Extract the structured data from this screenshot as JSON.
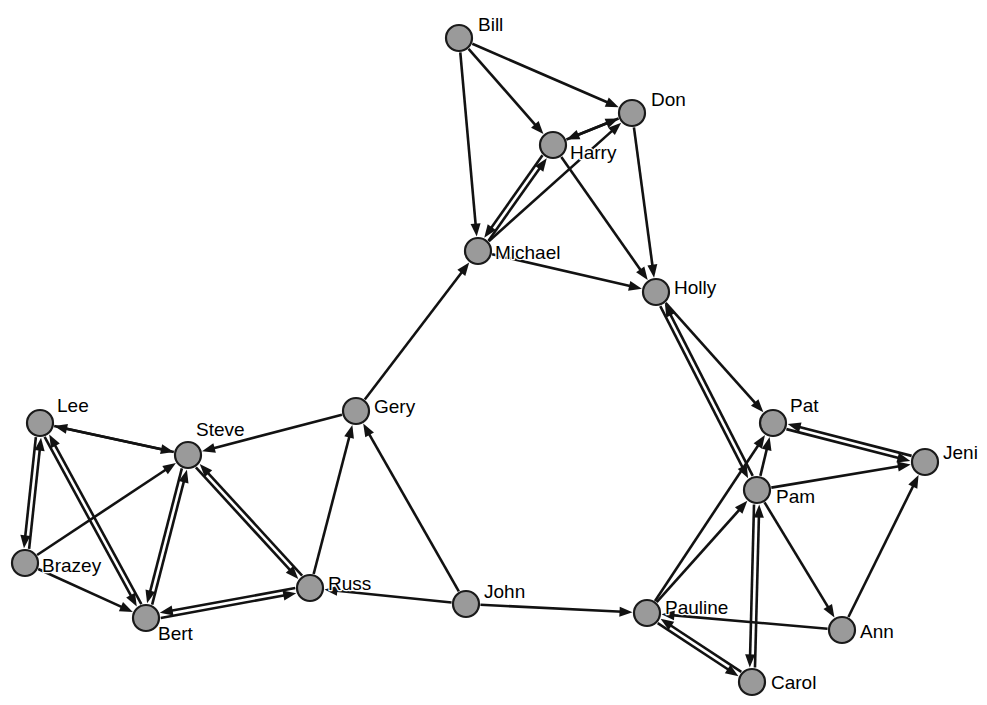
{
  "diagram": {
    "type": "directed-graph",
    "background_color": "#ffffff",
    "node_fill_color": "#9a9a9a",
    "node_stroke_color": "#1a1a1a",
    "edge_color": "#121212",
    "node_radius": 13,
    "canvas": {
      "width": 987,
      "height": 705
    }
  },
  "nodes": [
    {
      "id": "Bill",
      "label": "Bill",
      "x": 459,
      "y": 38,
      "label_dx": 19,
      "label_dy": -12
    },
    {
      "id": "Don",
      "label": "Don",
      "x": 632,
      "y": 113,
      "label_dx": 19,
      "label_dy": -12
    },
    {
      "id": "Harry",
      "label": "Harry",
      "x": 553,
      "y": 145,
      "label_dx": 17,
      "label_dy": 9
    },
    {
      "id": "Michael",
      "label": "Michael",
      "x": 478,
      "y": 251,
      "label_dx": 17,
      "label_dy": 3
    },
    {
      "id": "Holly",
      "label": "Holly",
      "x": 656,
      "y": 292,
      "label_dx": 18,
      "label_dy": -3
    },
    {
      "id": "Gery",
      "label": "Gery",
      "x": 356,
      "y": 411,
      "label_dx": 18,
      "label_dy": -3
    },
    {
      "id": "Lee",
      "label": "Lee",
      "x": 40,
      "y": 423,
      "label_dx": 17,
      "label_dy": -16
    },
    {
      "id": "Steve",
      "label": "Steve",
      "x": 188,
      "y": 455,
      "label_dx": 8,
      "label_dy": -24
    },
    {
      "id": "Pat",
      "label": "Pat",
      "x": 773,
      "y": 423,
      "label_dx": 17,
      "label_dy": -16
    },
    {
      "id": "Jeni",
      "label": "Jeni",
      "x": 925,
      "y": 462,
      "label_dx": 18,
      "label_dy": -8
    },
    {
      "id": "Pam",
      "label": "Pam",
      "x": 757,
      "y": 490,
      "label_dx": 19,
      "label_dy": 8
    },
    {
      "id": "Brazey",
      "label": "Brazey",
      "x": 25,
      "y": 563,
      "label_dx": 17,
      "label_dy": 4
    },
    {
      "id": "Russ",
      "label": "Russ",
      "x": 310,
      "y": 588,
      "label_dx": 18,
      "label_dy": -3
    },
    {
      "id": "John",
      "label": "John",
      "x": 466,
      "y": 604,
      "label_dx": 18,
      "label_dy": -11
    },
    {
      "id": "Pauline",
      "label": "Pauline",
      "x": 647,
      "y": 613,
      "label_dx": 18,
      "label_dy": -4
    },
    {
      "id": "Bert",
      "label": "Bert",
      "x": 146,
      "y": 618,
      "label_dx": 12,
      "label_dy": 17
    },
    {
      "id": "Ann",
      "label": "Ann",
      "x": 842,
      "y": 630,
      "label_dx": 18,
      "label_dy": 3
    },
    {
      "id": "Carol",
      "label": "Carol",
      "x": 752,
      "y": 682,
      "label_dx": 19,
      "label_dy": 2
    }
  ],
  "edges": [
    {
      "from": "Bill",
      "to": "Don",
      "directed": "forward"
    },
    {
      "from": "Bill",
      "to": "Harry",
      "directed": "forward"
    },
    {
      "from": "Bill",
      "to": "Michael",
      "directed": "forward"
    },
    {
      "from": "Don",
      "to": "Harry",
      "directed": "forward"
    },
    {
      "from": "Harry",
      "to": "Don",
      "directed": "forward"
    },
    {
      "from": "Harry",
      "to": "Michael",
      "directed": "both"
    },
    {
      "from": "Harry",
      "to": "Holly",
      "directed": "forward"
    },
    {
      "from": "Don",
      "to": "Holly",
      "directed": "forward"
    },
    {
      "from": "Michael",
      "to": "Don",
      "directed": "forward"
    },
    {
      "from": "Michael",
      "to": "Holly",
      "directed": "forward"
    },
    {
      "from": "Gery",
      "to": "Michael",
      "directed": "forward"
    },
    {
      "from": "Holly",
      "to": "Pat",
      "directed": "forward"
    },
    {
      "from": "Holly",
      "to": "Pam",
      "directed": "both"
    },
    {
      "from": "Lee",
      "to": "Steve",
      "directed": "forward"
    },
    {
      "from": "Lee",
      "to": "Brazey",
      "directed": "both"
    },
    {
      "from": "Lee",
      "to": "Bert",
      "directed": "both"
    },
    {
      "from": "Brazey",
      "to": "Steve",
      "directed": "forward"
    },
    {
      "from": "Brazey",
      "to": "Bert",
      "directed": "forward"
    },
    {
      "from": "Steve",
      "to": "Bert",
      "directed": "both"
    },
    {
      "from": "Steve",
      "to": "Russ",
      "directed": "both"
    },
    {
      "from": "Steve",
      "to": "Lee",
      "directed": "forward"
    },
    {
      "from": "Gery",
      "to": "Steve",
      "directed": "forward"
    },
    {
      "from": "Russ",
      "to": "Gery",
      "directed": "forward"
    },
    {
      "from": "Bert",
      "to": "Russ",
      "directed": "both"
    },
    {
      "from": "John",
      "to": "Gery",
      "directed": "forward"
    },
    {
      "from": "John",
      "to": "Russ",
      "directed": "forward"
    },
    {
      "from": "John",
      "to": "Pauline",
      "directed": "forward"
    },
    {
      "from": "Pat",
      "to": "Jeni",
      "directed": "both"
    },
    {
      "from": "Pam",
      "to": "Pat",
      "directed": "forward"
    },
    {
      "from": "Pam",
      "to": "Jeni",
      "directed": "forward"
    },
    {
      "from": "Pam",
      "to": "Ann",
      "directed": "forward"
    },
    {
      "from": "Pam",
      "to": "Carol",
      "directed": "both"
    },
    {
      "from": "Pauline",
      "to": "Pat",
      "directed": "forward"
    },
    {
      "from": "Pauline",
      "to": "Pam",
      "directed": "forward"
    },
    {
      "from": "Pauline",
      "to": "Carol",
      "directed": "both"
    },
    {
      "from": "Ann",
      "to": "Jeni",
      "directed": "forward"
    },
    {
      "from": "Ann",
      "to": "Pauline",
      "directed": "forward"
    }
  ]
}
